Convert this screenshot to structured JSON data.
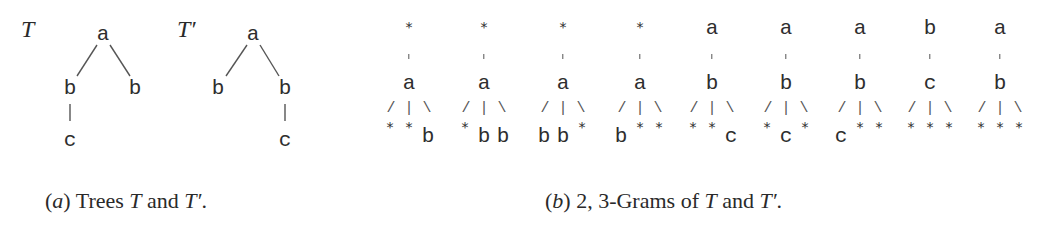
{
  "figure": {
    "panel_a": {
      "caption": {
        "prefix": "(",
        "label": "a",
        "suffix": ") Trees ",
        "t1": "T",
        "and": " and ",
        "t2": "T′",
        "end": "."
      },
      "trees": [
        {
          "name": "T",
          "root": "a",
          "children": [
            {
              "label": "b",
              "children": [
                {
                  "label": "c"
                }
              ]
            },
            {
              "label": "b",
              "children": []
            }
          ]
        },
        {
          "name": "T′",
          "root": "a",
          "children": [
            {
              "label": "b",
              "children": []
            },
            {
              "label": "b",
              "children": [
                {
                  "label": "c"
                }
              ]
            }
          ]
        }
      ]
    },
    "panel_b": {
      "caption": {
        "prefix": "(",
        "label": "b",
        "suffix": ") 2, 3-Grams of ",
        "t1": "T",
        "and": " and ",
        "t2": "T′",
        "end": "."
      },
      "fan_glyph": "/|\\",
      "grams": [
        {
          "parent": "*",
          "node": "a",
          "children": [
            "*",
            "*",
            "b"
          ]
        },
        {
          "parent": "*",
          "node": "a",
          "children": [
            "*",
            "b",
            "b"
          ]
        },
        {
          "parent": "*",
          "node": "a",
          "children": [
            "b",
            "b",
            "*"
          ]
        },
        {
          "parent": "*",
          "node": "a",
          "children": [
            "b",
            "*",
            "*"
          ]
        },
        {
          "parent": "a",
          "node": "b",
          "children": [
            "*",
            "*",
            "c"
          ]
        },
        {
          "parent": "a",
          "node": "b",
          "children": [
            "*",
            "c",
            "*"
          ]
        },
        {
          "parent": "a",
          "node": "b",
          "children": [
            "c",
            "*",
            "*"
          ]
        },
        {
          "parent": "b",
          "node": "c",
          "children": [
            "*",
            "*",
            "*"
          ]
        },
        {
          "parent": "a",
          "node": "b",
          "children": [
            "*",
            "*",
            "*"
          ]
        }
      ]
    }
  }
}
